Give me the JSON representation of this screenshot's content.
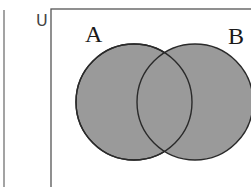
{
  "diagram": {
    "type": "venn",
    "universe_label": "U",
    "sets": [
      {
        "name": "A",
        "label": "A",
        "shaded": true
      },
      {
        "name": "B",
        "label": "B",
        "shaded": true
      }
    ],
    "shaded_region": "A ∪ B",
    "colors": {
      "fill": "#9a9a9a",
      "stroke": "#2a2a2a",
      "background": "#ffffff",
      "frame": "#555555"
    }
  }
}
